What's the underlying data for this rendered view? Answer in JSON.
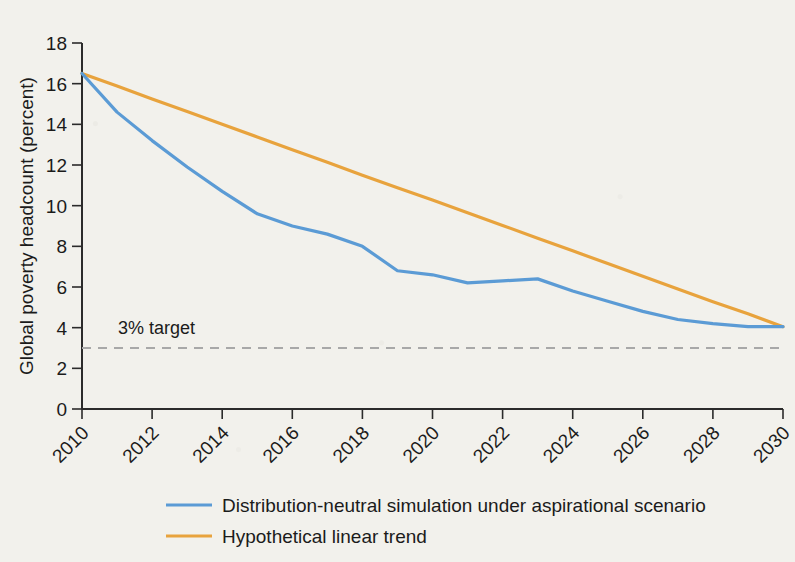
{
  "chart_data": {
    "type": "line",
    "title": "",
    "xlabel": "",
    "ylabel": "Global poverty headcount (percent)",
    "xlim": [
      2010,
      2030
    ],
    "ylim": [
      0,
      18
    ],
    "ytick_labels": [
      "0",
      "2",
      "4",
      "6",
      "8",
      "10",
      "12",
      "14",
      "16",
      "18"
    ],
    "ytick_values": [
      0,
      2,
      4,
      6,
      8,
      10,
      12,
      14,
      16,
      18
    ],
    "xtick_labels": [
      "2010",
      "2012",
      "2014",
      "2016",
      "2018",
      "2020",
      "2022",
      "2024",
      "2026",
      "2028",
      "2030"
    ],
    "xtick_values": [
      2010,
      2012,
      2014,
      2016,
      2018,
      2020,
      2022,
      2024,
      2026,
      2028,
      2030
    ],
    "grid": false,
    "legend_position": "bottom-left",
    "x": [
      2010,
      2011,
      2012,
      2013,
      2014,
      2015,
      2016,
      2017,
      2018,
      2019,
      2020,
      2021,
      2022,
      2023,
      2024,
      2025,
      2026,
      2027,
      2028,
      2029,
      2030
    ],
    "series": [
      {
        "name": "Distribution-neutral simulation under aspirational scenario",
        "color": "#5B9BD5",
        "values": [
          16.5,
          14.6,
          13.2,
          11.9,
          10.7,
          9.6,
          9.0,
          8.6,
          8.0,
          6.8,
          6.6,
          6.2,
          6.3,
          6.4,
          5.8,
          5.3,
          4.8,
          4.4,
          4.2,
          4.05,
          4.05
        ]
      },
      {
        "name": "Hypothetical linear trend",
        "color": "#E8A33D",
        "values": [
          16.5,
          15.88,
          15.25,
          14.63,
          14.0,
          13.38,
          12.75,
          12.13,
          11.5,
          10.88,
          10.28,
          9.65,
          9.03,
          8.4,
          7.78,
          7.15,
          6.53,
          5.9,
          5.28,
          4.68,
          4.05
        ]
      }
    ],
    "annotations": [
      {
        "name": "target-line",
        "label": "3% target",
        "value": 3,
        "color": "#a8a8a8",
        "style": "dashed"
      }
    ]
  },
  "legend": {
    "entries": [
      {
        "label": "Distribution-neutral simulation under aspirational scenario",
        "color": "#5B9BD5"
      },
      {
        "label": "Hypothetical linear trend",
        "color": "#E8A33D"
      }
    ]
  },
  "colors": {
    "background": "#f2f1ec",
    "axis": "#2b2b2b",
    "text": "#1b1b1b",
    "series_blue": "#5B9BD5",
    "series_orange": "#E8A33D",
    "target_dash": "#a8a8a8"
  }
}
